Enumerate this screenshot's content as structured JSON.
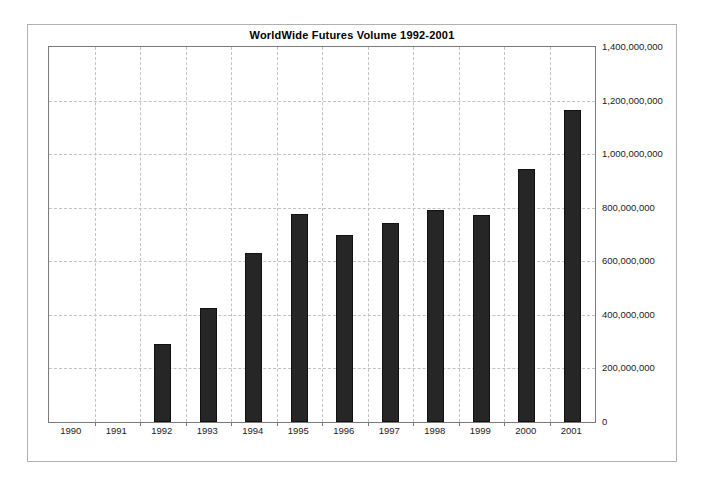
{
  "chart_data": {
    "type": "bar",
    "title": "WorldWide Futures Volume 1992-2001",
    "xlabel": "",
    "ylabel": "",
    "categories": [
      "1990",
      "1991",
      "1992",
      "1993",
      "1994",
      "1995",
      "1996",
      "1997",
      "1998",
      "1999",
      "2000",
      "2001"
    ],
    "values": [
      null,
      null,
      291000000,
      425000000,
      631000000,
      776000000,
      698000000,
      743000000,
      791000000,
      773000000,
      945000000,
      1165000000
    ],
    "ylim": [
      0,
      1400000000
    ],
    "y_ticks": [
      0,
      200000000,
      400000000,
      600000000,
      800000000,
      1000000000,
      1200000000,
      1400000000
    ],
    "y_tick_labels": [
      "0",
      "200,000,000",
      "400,000,000",
      "600,000,000",
      "800,000,000",
      "1,000,000,000",
      "1,200,000,000",
      "1,400,000,000"
    ],
    "grid": true,
    "grid_style": "dashed",
    "grid_color": "#c2c2c2",
    "y_axis_position": "right",
    "legend": false,
    "legend_position": "none",
    "bar_color": "#262626",
    "plot_background": "#ffffff",
    "frame_color": "#b0b0b0"
  }
}
